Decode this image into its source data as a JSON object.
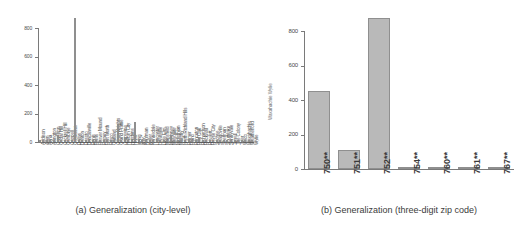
{
  "chart_data": [
    {
      "type": "bar",
      "panel": "a",
      "title": "(a)  Generalization (city-level)",
      "xlabel": "",
      "ylabel": "",
      "ylim": [
        0,
        900
      ],
      "yticks": [
        0,
        200,
        400,
        600,
        800
      ],
      "grid": false,
      "legend": "none",
      "categories": [
        "Addison",
        "Allen",
        "Anna",
        "Arlington",
        "Carrollton",
        "Cedar Hill",
        "Cockrell Hill",
        "Combine",
        "Coppell",
        "Corsicana",
        "Dallas",
        "Denton",
        "Desoto",
        "Duncanville",
        "Ennis",
        "Ferris",
        "Flower Mound",
        "Forney",
        "Fort Worth",
        "Frisco",
        "Garland",
        "Glenn Heights",
        "Grand Prairie",
        "Grapevine",
        "Haltom City",
        "Hutchins",
        "Hurst",
        "Irving",
        "Italy",
        "Kaufman",
        "Keller",
        "Kennedale",
        "Lancaster",
        "Lewisville",
        "Little Elm",
        "Mansfield",
        "McKinney",
        "Mesquite",
        "Midlothian",
        "Murphy",
        "North Richland Hills",
        "Palmer",
        "Plano",
        "Princeton",
        "Red Oak",
        "Richardson",
        "Rockwall",
        "Rowlett",
        "Royse City",
        "Sachse",
        "Seagoville",
        "Sherman",
        "Southlake",
        "Sunnyvale",
        "Terrell",
        "The Colony",
        "Tyler",
        "Waco",
        "Waxahachie",
        "Weatherford",
        "Wylie"
      ],
      "values": [
        12,
        8,
        3,
        6,
        10,
        48,
        5,
        3,
        9,
        4,
        875,
        14,
        9,
        12,
        5,
        3,
        8,
        4,
        9,
        7,
        11,
        4,
        130,
        8,
        38,
        5,
        7,
        140,
        3,
        4,
        9,
        4,
        8,
        12,
        6,
        7,
        10,
        48,
        6,
        4,
        9,
        3,
        22,
        4,
        6,
        28,
        7,
        9,
        5,
        4,
        8,
        5,
        6,
        4,
        7,
        9,
        5,
        6,
        8,
        4,
        7
      ]
    },
    {
      "type": "bar",
      "panel": "b",
      "title": "(b)  Generalization (three-digit zip code)",
      "xlabel": "",
      "ylabel": "",
      "ylim": [
        0,
        900
      ],
      "yticks": [
        0,
        200,
        400,
        600,
        800
      ],
      "grid": false,
      "legend": "none",
      "categories": [
        "750**",
        "751**",
        "752**",
        "754**",
        "760**",
        "761**",
        "767**"
      ],
      "values": [
        455,
        110,
        875,
        2,
        10,
        2,
        1
      ]
    }
  ],
  "captions": {
    "a": "(a)  Generalization (city-level)",
    "b": "(b)  Generalization (three-digit zip code)"
  },
  "overflow_label": "Waxahachie Wylie"
}
